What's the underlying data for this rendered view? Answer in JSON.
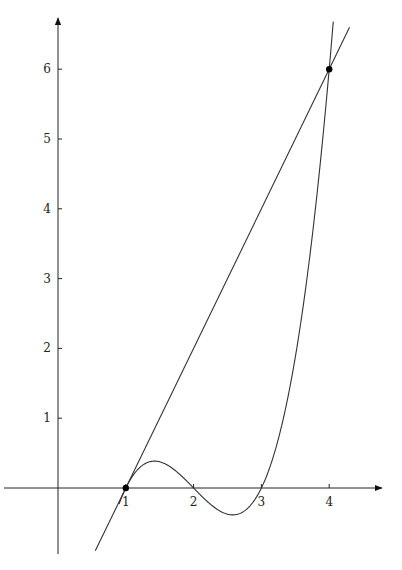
{
  "chart_data": {
    "type": "line",
    "title": "",
    "xlabel": "",
    "ylabel": "",
    "xlim": [
      -0.8,
      4.6
    ],
    "ylim": [
      -0.95,
      6.7
    ],
    "grid": false,
    "legend": null,
    "x_ticks": [
      1,
      2,
      3,
      4
    ],
    "y_ticks": [
      1,
      2,
      3,
      4,
      5,
      6
    ],
    "x_tick_labels": [
      "1",
      "2",
      "3",
      "4"
    ],
    "y_tick_labels": [
      "1",
      "2",
      "3",
      "4",
      "5",
      "6"
    ],
    "series": [
      {
        "name": "cubic",
        "expression": "(x-1)(x-2)(x-3)",
        "x": [
          0.9,
          1.0,
          1.2,
          1.4,
          1.6,
          1.8,
          2.0,
          2.2,
          2.4,
          2.6,
          2.8,
          3.0,
          3.2,
          3.4,
          3.6,
          3.8,
          4.0,
          4.05
        ],
        "values": [
          -0.759,
          0.0,
          0.336,
          0.384,
          0.336,
          0.192,
          0.0,
          -0.192,
          -0.336,
          -0.384,
          -0.336,
          0.0,
          0.528,
          1.344,
          2.496,
          4.032,
          6.0,
          6.56
        ]
      },
      {
        "name": "secant line",
        "expression": "2x-2",
        "x": [
          0.55,
          4.3
        ],
        "values": [
          -0.9,
          6.6
        ]
      }
    ],
    "points": [
      {
        "label": "",
        "x": 1,
        "y": 0
      },
      {
        "label": "",
        "x": 4,
        "y": 6
      }
    ]
  },
  "axes": {
    "origin_px": [
      58,
      488
    ],
    "px_per_x": 67.8,
    "px_per_y": 69.8
  }
}
